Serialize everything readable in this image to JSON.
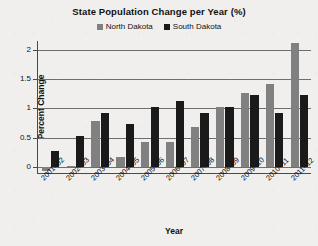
{
  "chart_data": {
    "type": "bar",
    "title": "State Population Change per Year (%)",
    "xlabel": "Year",
    "ylabel": "Percent Change",
    "ylim": [
      -0.1,
      2.15
    ],
    "yticks": [
      "0",
      "0.5",
      "1",
      "1.5",
      "2"
    ],
    "ytick_values": [
      0,
      0.5,
      1,
      1.5,
      2
    ],
    "grid": true,
    "legend_position": "top-center",
    "categories": [
      "2001–02",
      "2002–03",
      "2003–04",
      "2004–05",
      "2005–06",
      "2006–07",
      "2007–08",
      "2008–09",
      "2009–10",
      "2010–11",
      "2011–12"
    ],
    "series": [
      {
        "name": "North Dakota",
        "color": "#808080",
        "values": [
          -0.07,
          0.02,
          0.78,
          0.18,
          0.43,
          0.43,
          0.69,
          1.02,
          1.27,
          1.42,
          2.11
        ]
      },
      {
        "name": "South Dakota",
        "color": "#1a1a1a",
        "values": [
          0.27,
          0.53,
          0.93,
          0.73,
          1.02,
          1.12,
          0.93,
          1.02,
          1.23,
          0.93,
          1.23
        ]
      }
    ]
  },
  "colors": {
    "background": "#f0efed",
    "gridline": "#6e6e6e",
    "axis": "#4a4a4a",
    "north_dakota": "#808080",
    "south_dakota": "#1a1a1a"
  }
}
